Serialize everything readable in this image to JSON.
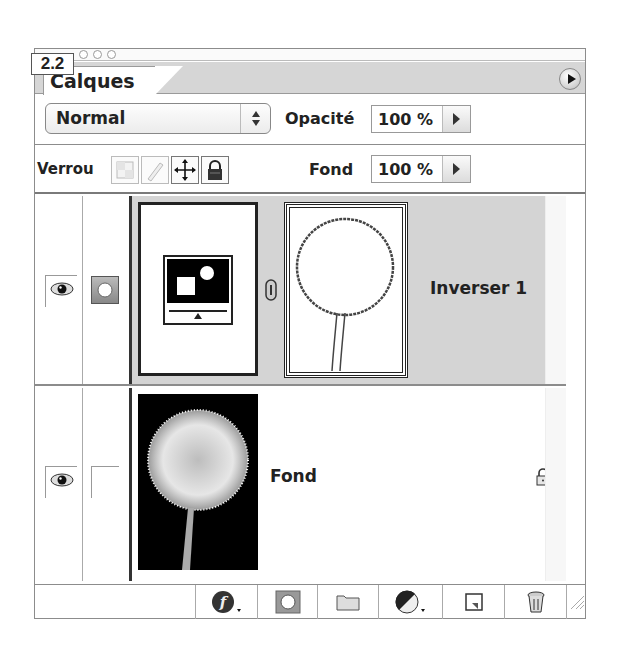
{
  "figure_label": "2.2",
  "panel": {
    "tab_label": "Calques",
    "menu_button": "palette-menu-arrow"
  },
  "blend": {
    "mode": "Normal",
    "opacity_label": "Opacité",
    "opacity_value": "100 %"
  },
  "lock": {
    "label": "Verrou",
    "buttons": [
      {
        "name": "lock-transparent-pixels",
        "icon": "checker-square-icon"
      },
      {
        "name": "lock-image-pixels",
        "icon": "brush-icon"
      },
      {
        "name": "lock-position",
        "icon": "move-arrows-icon"
      },
      {
        "name": "lock-all",
        "icon": "padlock-icon"
      }
    ],
    "fill_label": "Fond",
    "fill_value": "100 %"
  },
  "layers": [
    {
      "name": "Inverser 1",
      "type": "adjustment",
      "selected": true,
      "visible": true,
      "thumbnail_icon": "invert-adjustment-icon",
      "mask_icon": "dandelion-mask-outline",
      "linked": true
    },
    {
      "name": "Fond",
      "type": "background",
      "selected": false,
      "visible": true,
      "thumbnail_icon": "dandelion-photo",
      "locked": true
    }
  ],
  "toolbar": {
    "buttons": [
      {
        "name": "layer-style",
        "icon": "fx-icon"
      },
      {
        "name": "add-mask",
        "icon": "mask-icon"
      },
      {
        "name": "new-group",
        "icon": "folder-icon"
      },
      {
        "name": "new-adjustment-layer",
        "icon": "half-circle-icon"
      },
      {
        "name": "new-layer",
        "icon": "new-layer-icon"
      },
      {
        "name": "delete-layer",
        "icon": "trash-icon"
      }
    ]
  },
  "colors": {
    "selected_layer_bg": "#d4d4d4",
    "tab_strip_bg": "#d6d6d6",
    "border": "#8c8c8c"
  }
}
